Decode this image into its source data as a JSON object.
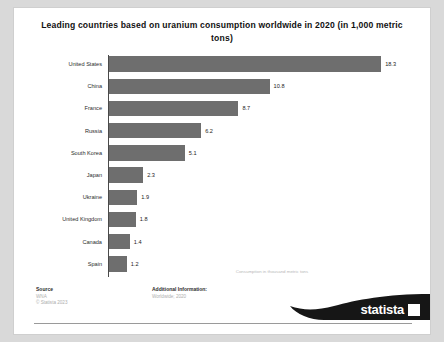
{
  "chart_data": {
    "type": "bar",
    "orientation": "horizontal",
    "title": "Leading countries based on uranium consumption worldwide in 2020 (in 1,000 metric tons)",
    "categories": [
      "United States",
      "China",
      "France",
      "Russia",
      "South Korea",
      "Japan",
      "Ukraine",
      "United Kingdom",
      "Canada",
      "Spain"
    ],
    "values": [
      18.3,
      10.8,
      8.7,
      6.2,
      5.1,
      2.3,
      1.9,
      1.8,
      1.4,
      1.2
    ],
    "value_labels": [
      "18.3",
      "10.8",
      "8.7",
      "6.2",
      "5.1",
      "2.3",
      "1.9",
      "1.8",
      "1.4",
      "1.2"
    ],
    "xlabel": "Consumption in thousand metric tons",
    "ylabel": "",
    "xlim": [
      0,
      19.5
    ],
    "grid": false,
    "legend": false,
    "bar_color": "#6e6e6e"
  },
  "footer": {
    "source_heading": "Source",
    "source_lines": [
      "WNA",
      "© Statista 2023"
    ],
    "additional_heading": "Additional Information:",
    "additional_lines": [
      "Worldwide; 2020"
    ]
  },
  "branding": {
    "logo_text": "statista"
  }
}
